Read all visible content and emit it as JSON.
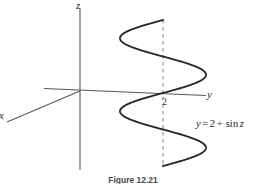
{
  "figure": {
    "caption": "Figure 12.21",
    "background_color": "#ffffff",
    "ink_color": "#2b2b2b",
    "axis_color": "#55555a",
    "curve_color": "#232323",
    "dash_color": "#7a7a7a"
  },
  "axes": {
    "z_label": "z",
    "y_label": "y",
    "x_label": "x",
    "tick_label": "2",
    "origin": {
      "x": 80,
      "y": 91
    }
  },
  "equation": {
    "lhs": "y",
    "equals": "=",
    "constant": "2",
    "plus": "+",
    "term": "sin",
    "variable": "z",
    "full": "y = 2 + sin z"
  },
  "chart_data": {
    "type": "line",
    "title": "Figure 12.21",
    "subtitle": "",
    "xlabel": "y",
    "ylabel": "z",
    "grid": false,
    "legend_position": "none",
    "annotations": [
      {
        "text": "y = 2 + sin z",
        "x": 196,
        "y": 119
      },
      {
        "text": "2",
        "x": 163,
        "y": 99
      }
    ],
    "axis_ranges": {
      "y_axis_screen": [
        80,
        214
      ],
      "z_axis_screen": [
        8,
        170
      ]
    },
    "reference_line": {
      "name": "y = 2 plane trace",
      "style": "dashed",
      "x": 163,
      "from_y": 20,
      "to_y": 166
    },
    "curve": {
      "equation": "y = 2 + sin z",
      "amplitude": 1,
      "offset": 2,
      "periods": 2,
      "center_screen_x": 163,
      "amplitude_screen_px": 43,
      "z_top_screen": 20,
      "z_bottom_screen": 166,
      "extreme_left_screen_x": 120,
      "extreme_right_screen_x": 206
    },
    "series": [
      {
        "name": "y = 2 + sin z",
        "x": [
          2.0,
          2.85,
          3.0,
          2.85,
          2.0,
          1.15,
          1.0,
          1.15,
          2.0,
          2.85,
          3.0,
          2.85,
          2.0,
          1.15,
          1.0,
          1.15,
          2.0
        ],
        "y": [
          6.28,
          5.5,
          4.71,
          3.93,
          3.14,
          2.36,
          1.57,
          0.79,
          0.0,
          -0.79,
          -1.57,
          -2.36,
          -3.14,
          -3.93,
          -4.71,
          -5.5,
          -6.28
        ]
      }
    ]
  }
}
